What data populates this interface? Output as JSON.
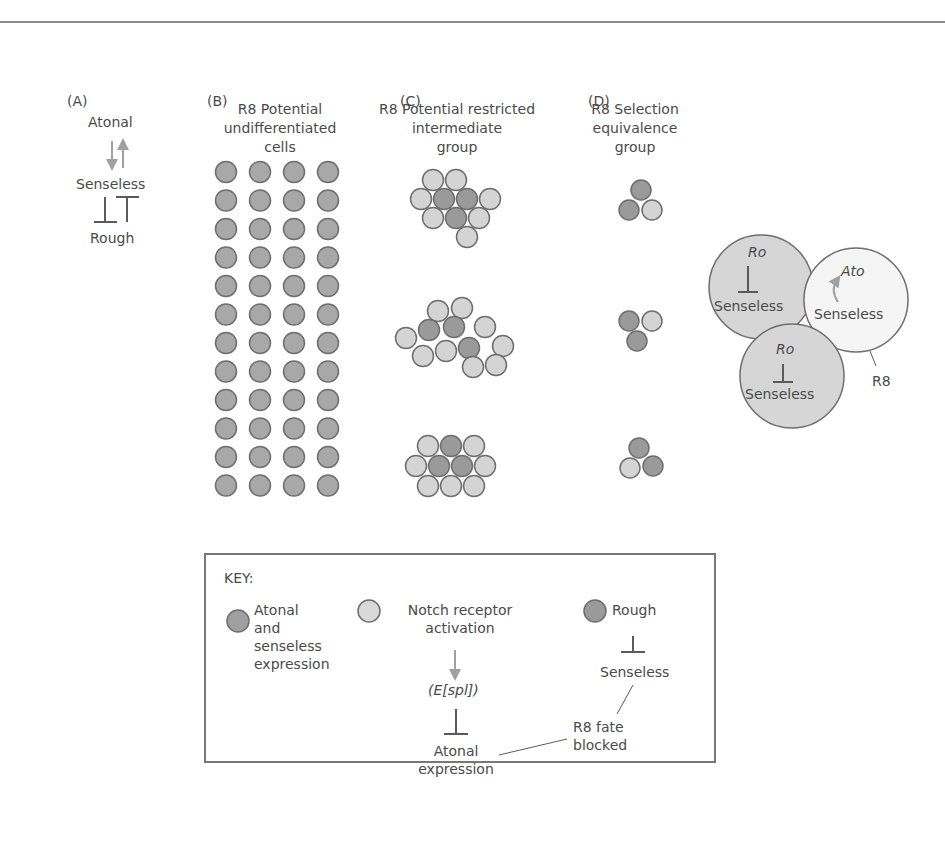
{
  "panels": {
    "A": {
      "label": "(A)",
      "atonal": "Atonal",
      "senseless": "Senseless",
      "rough": "Rough"
    },
    "B": {
      "label": "(B)",
      "title_lines": [
        "R8 Potential",
        "undifferentiated",
        "cells"
      ],
      "grid": {
        "rows": 12,
        "cols": 4,
        "cell_type": "atonal_senseless"
      }
    },
    "C": {
      "label": "(C)",
      "title_lines": [
        "R8 Potential restricted",
        "intermediate",
        "group"
      ],
      "clusters": [
        {
          "cells": 10,
          "dark": 3,
          "light": 7
        },
        {
          "cells": 12,
          "dark": 3,
          "light": 9
        },
        {
          "cells": 10,
          "dark": 3,
          "light": 7
        }
      ]
    },
    "D": {
      "label": "(D)",
      "title_lines": [
        "R8 Selection",
        "equivalence",
        "group"
      ],
      "clusters": [
        {
          "cells": 3,
          "dark": 2,
          "light": 1
        },
        {
          "cells": 3,
          "dark": 2,
          "light": 1
        },
        {
          "cells": 3,
          "dark": 2,
          "light": 1
        }
      ]
    }
  },
  "detail": {
    "cell1": {
      "top": "Ro",
      "bottom": "Senseless"
    },
    "cell2": {
      "top": "Ato",
      "bottom": "Senseless"
    },
    "cell3": {
      "top": "Ro",
      "bottom": "Senseless"
    },
    "r8_label": "R8"
  },
  "key": {
    "title": "KEY:",
    "item1_lines": [
      "Atonal",
      "and",
      "senseless",
      "expression"
    ],
    "item2_lines": [
      "Notch receptor",
      "activation"
    ],
    "espl": "(E[spl])",
    "atonal_expr_lines": [
      "Atonal",
      "expression"
    ],
    "item3": "Rough",
    "senseless": "Senseless",
    "fate_lines": [
      "R8 fate",
      "blocked"
    ]
  },
  "colors": {
    "dark_cell": "#9a9a9a",
    "mid_cell": "#a8a8a8",
    "light_cell": "#d4d4d4",
    "pale_cell": "#f2f2f2",
    "outline": "#6e6e6e",
    "arrow": "#a0a0a0",
    "text": "#4a4a4a"
  }
}
